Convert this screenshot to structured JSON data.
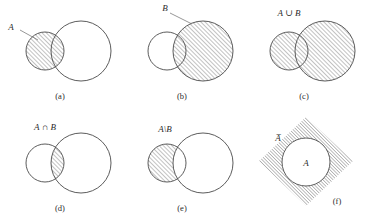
{
  "figure": {
    "background_color": "#ffffff",
    "outline_color": "#4a4a4a",
    "hatch_color": "#6e6e6e",
    "hatch_direction": "diagonal-up-right",
    "panels": [
      {
        "id": "a",
        "caption": "(a)",
        "label": "A",
        "label_kind": "leader-line",
        "description": "Set A shaded: small left circle fully hatched, large right circle unshaded",
        "shaded_region": "A"
      },
      {
        "id": "b",
        "caption": "(b)",
        "label": "B",
        "label_kind": "leader-line",
        "description": "Set B shaded: large right circle fully hatched, small left circle unshaded",
        "shaded_region": "B"
      },
      {
        "id": "c",
        "caption": "(c)",
        "label": "A ∪ B",
        "label_kind": "floating",
        "description": "Union of A and B: both circles fully hatched",
        "shaded_region": "A union B"
      },
      {
        "id": "d",
        "caption": "(d)",
        "label": "A ∩ B",
        "label_kind": "floating",
        "description": "Intersection of A and B: only the overlapping lens is hatched",
        "shaded_region": "A intersect B"
      },
      {
        "id": "e",
        "caption": "(e)",
        "label": "A\\B",
        "label_kind": "floating",
        "description": "Difference A minus B: part of small circle outside the large circle is hatched",
        "shaded_region": "A minus B"
      },
      {
        "id": "f",
        "caption": "(f)",
        "label": "A̅",
        "inner_label": "A",
        "label_kind": "floating",
        "description": "Complement of A: hatched rotated square universe with white circle A inside",
        "shaded_region": "complement of A"
      }
    ]
  }
}
